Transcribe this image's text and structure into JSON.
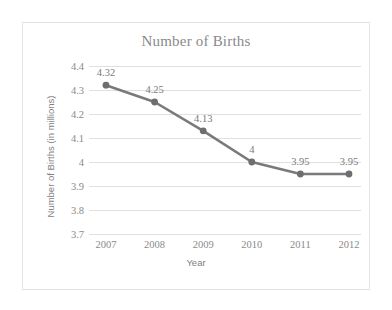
{
  "chart_data": {
    "type": "line",
    "title": "Number of Births",
    "xlabel": "Year",
    "ylabel": "Number of Births (in millions)",
    "categories": [
      "2007",
      "2008",
      "2009",
      "2010",
      "2011",
      "2012"
    ],
    "values": [
      4.32,
      4.25,
      4.13,
      4,
      3.95,
      3.95
    ],
    "point_labels": [
      "4.32",
      "4.25",
      "4.13",
      "4",
      "3.95",
      "3.95"
    ],
    "yticks": [
      "4.4",
      "4.3",
      "4.2",
      "4.1",
      "4",
      "3.9",
      "3.8",
      "3.7"
    ],
    "ytick_values": [
      4.4,
      4.3,
      4.2,
      4.1,
      4.0,
      3.9,
      3.8,
      3.7
    ],
    "ylim": [
      3.7,
      4.4
    ],
    "grid": "horizontal",
    "legend": "none",
    "series": [
      {
        "name": "Number of Births",
        "values": [
          4.32,
          4.25,
          4.13,
          4,
          3.95,
          3.95
        ]
      }
    ],
    "colors": {
      "line": "#7a7a7a",
      "marker": "#6e6e6e",
      "grid": "#e0e0e0",
      "text": "#8a8a8a",
      "frame": "#e3e3e3",
      "background": "#ffffff"
    }
  }
}
